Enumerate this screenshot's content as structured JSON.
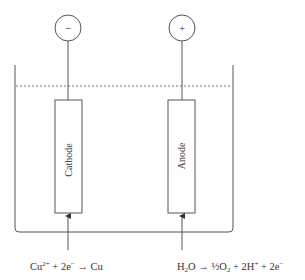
{
  "diagram": {
    "terminals": {
      "negative": {
        "symbol": "−"
      },
      "positive": {
        "symbol": "+"
      }
    },
    "electrodes": {
      "cathode": {
        "label": "Cathode"
      },
      "anode": {
        "label": "Anode"
      }
    },
    "reactions": {
      "cathode": {
        "species1": "Cu",
        "species1_sup": "2+",
        "op1": " + 2e",
        "op1_sup": "−",
        "arrow": " → ",
        "product": "Cu"
      },
      "anode": {
        "part1": "H",
        "part1_sub": "2",
        "part2": "O",
        "arrow": " → ",
        "part3": "½O",
        "part3_sub": "2",
        "part4": " + 2H",
        "part4_sup": "+",
        "part5": " + 2e",
        "part5_sup": "−"
      }
    },
    "colors": {
      "line": "#555555",
      "text": "#333333"
    }
  }
}
